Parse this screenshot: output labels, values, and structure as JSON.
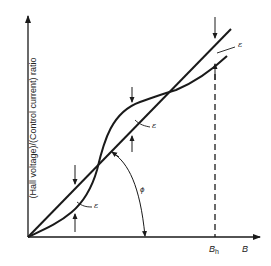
{
  "figure": {
    "type": "hall-effect-linearity-diagram",
    "y_axis_label": "(Hall voltage)/(Control current) ratio",
    "x_axis_label": "B",
    "dashed_marker_label_main": "B",
    "dashed_marker_label_sub": "h",
    "angle_label": "ϕ",
    "error_label": "ε",
    "colors": {
      "line": "#1a1a1a",
      "background": "#ffffff"
    }
  },
  "annotations": {
    "eps_upper_right": "ε",
    "eps_middle": "ε",
    "eps_lower_left": "ε"
  }
}
